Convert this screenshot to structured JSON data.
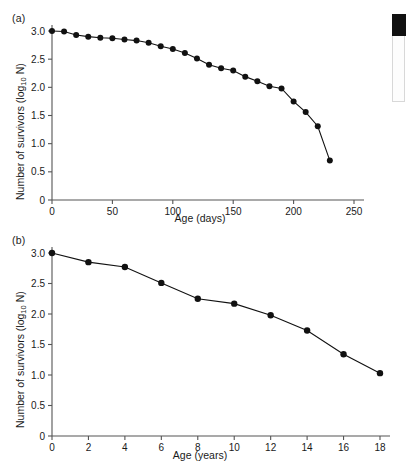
{
  "figure": {
    "panels": [
      {
        "id": "a",
        "label": "(a)",
        "xlabel": "Age (days)",
        "ylabel_main": "Number of survivors (log",
        "ylabel_sub": "10",
        "ylabel_tail": " N)"
      },
      {
        "id": "b",
        "label": "(b)",
        "xlabel": "Age (years)",
        "ylabel_main": "Number of survivors (log",
        "ylabel_sub": "10",
        "ylabel_tail": " N)"
      }
    ]
  },
  "scrollbar": {
    "name": "vertical-scrollbar",
    "thumb_position": "top"
  },
  "chart_data": [
    {
      "type": "line",
      "panel": "a",
      "title": "",
      "xlabel": "Age (days)",
      "ylabel": "Number of survivors (log10 N)",
      "xlim": [
        0,
        250
      ],
      "ylim": [
        0,
        3.0
      ],
      "xticks": [
        0,
        50,
        100,
        150,
        200,
        250
      ],
      "xtick_labels": [
        "0",
        "50",
        "100",
        "150",
        "200",
        "250"
      ],
      "yticks": [
        0,
        0.5,
        1.0,
        1.5,
        2.0,
        2.5,
        3.0
      ],
      "ytick_labels": [
        "0",
        "0.5",
        "1.0",
        "1.5",
        "2.0",
        "2.5",
        "3.0"
      ],
      "grid": false,
      "legend": "none",
      "marker": "filled-circle",
      "x": [
        0,
        10,
        20,
        30,
        40,
        50,
        60,
        70,
        80,
        90,
        100,
        110,
        120,
        130,
        140,
        150,
        160,
        170,
        180,
        190,
        200,
        210,
        220,
        230
      ],
      "values": [
        3.0,
        2.99,
        2.93,
        2.9,
        2.88,
        2.87,
        2.85,
        2.83,
        2.79,
        2.73,
        2.68,
        2.61,
        2.51,
        2.4,
        2.34,
        2.3,
        2.19,
        2.11,
        2.02,
        1.98,
        1.75,
        1.56,
        1.31,
        0.7
      ]
    },
    {
      "type": "line",
      "panel": "b",
      "title": "",
      "xlabel": "Age (years)",
      "ylabel": "Number of survivors (log10 N)",
      "xlim": [
        0,
        18
      ],
      "ylim": [
        0,
        3.0
      ],
      "xticks": [
        0,
        2,
        4,
        6,
        8,
        10,
        12,
        14,
        16,
        18
      ],
      "xtick_labels": [
        "0",
        "2",
        "4",
        "6",
        "8",
        "10",
        "12",
        "14",
        "16",
        "18"
      ],
      "yticks": [
        0,
        0.5,
        1.0,
        1.5,
        2.0,
        2.5,
        3.0
      ],
      "ytick_labels": [
        "0",
        "0.5",
        "1.0",
        "1.5",
        "2.0",
        "2.5",
        "3.0"
      ],
      "grid": false,
      "legend": "none",
      "marker": "filled-circle",
      "x": [
        0,
        2,
        4,
        6,
        8,
        10,
        12,
        14,
        16,
        18
      ],
      "values": [
        3.0,
        2.85,
        2.77,
        2.51,
        2.25,
        2.17,
        1.98,
        1.73,
        1.34,
        1.03
      ]
    }
  ]
}
